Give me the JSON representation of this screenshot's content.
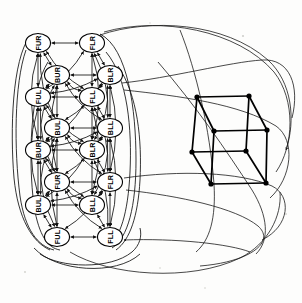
{
  "figure": {
    "background_color": "#fdfdfc",
    "ink_color": "#000000",
    "node_shape": "ellipse",
    "node_fill": "#ffffff",
    "edge_style": "directed-arrow"
  },
  "graph": {
    "name": "octant-transition-graph",
    "node_count": 16,
    "label_vocabulary": [
      "FUR",
      "FLR",
      "BUR",
      "BLR",
      "FUL",
      "FLL",
      "BUL",
      "BLL"
    ],
    "nodes": [
      {
        "id": "n0",
        "label": "FUR",
        "cx": 38,
        "cy": 43,
        "rx": 12.5,
        "ry": 9.5
      },
      {
        "id": "n1",
        "label": "FLR",
        "cx": 92,
        "cy": 43,
        "rx": 12.5,
        "ry": 9.5
      },
      {
        "id": "n2",
        "label": "BUR",
        "cx": 57,
        "cy": 75,
        "rx": 12.5,
        "ry": 9.5
      },
      {
        "id": "n3",
        "label": "BLR",
        "cx": 110,
        "cy": 75,
        "rx": 12.5,
        "ry": 9.5
      },
      {
        "id": "n4",
        "label": "FUL",
        "cx": 38,
        "cy": 97,
        "rx": 12.5,
        "ry": 9.5
      },
      {
        "id": "n5",
        "label": "FLL",
        "cx": 92,
        "cy": 97,
        "rx": 12.5,
        "ry": 9.5
      },
      {
        "id": "n6",
        "label": "BUL",
        "cx": 57,
        "cy": 128,
        "rx": 12.5,
        "ry": 9.5
      },
      {
        "id": "n7",
        "label": "BLL",
        "cx": 110,
        "cy": 128,
        "rx": 12.5,
        "ry": 9.5
      },
      {
        "id": "n8",
        "label": "BUR",
        "cx": 38,
        "cy": 150,
        "rx": 12.5,
        "ry": 9.5
      },
      {
        "id": "n9",
        "label": "BLR",
        "cx": 92,
        "cy": 150,
        "rx": 12.5,
        "ry": 9.5
      },
      {
        "id": "n10",
        "label": "FUR",
        "cx": 57,
        "cy": 182,
        "rx": 12.5,
        "ry": 9.5
      },
      {
        "id": "n11",
        "label": "FLR",
        "cx": 110,
        "cy": 182,
        "rx": 12.5,
        "ry": 9.5
      },
      {
        "id": "n12",
        "label": "BUL",
        "cx": 38,
        "cy": 205,
        "rx": 12.5,
        "ry": 9.5
      },
      {
        "id": "n13",
        "label": "BLL",
        "cx": 92,
        "cy": 205,
        "rx": 12.5,
        "ry": 9.5
      },
      {
        "id": "n14",
        "label": "FUL",
        "cx": 57,
        "cy": 237,
        "rx": 12.5,
        "ry": 9.5
      },
      {
        "id": "n15",
        "label": "FLL",
        "cx": 110,
        "cy": 237,
        "rx": 12.5,
        "ry": 9.5
      }
    ],
    "horizontal_pairs": [
      [
        "n0",
        "n1"
      ],
      [
        "n2",
        "n3"
      ],
      [
        "n4",
        "n5"
      ],
      [
        "n6",
        "n7"
      ],
      [
        "n8",
        "n9"
      ],
      [
        "n10",
        "n11"
      ],
      [
        "n12",
        "n13"
      ],
      [
        "n14",
        "n15"
      ]
    ],
    "vertical_pairs": [
      [
        "n0",
        "n4"
      ],
      [
        "n4",
        "n8"
      ],
      [
        "n8",
        "n12"
      ],
      [
        "n2",
        "n6"
      ],
      [
        "n6",
        "n10"
      ],
      [
        "n10",
        "n14"
      ],
      [
        "n1",
        "n5"
      ],
      [
        "n5",
        "n9"
      ],
      [
        "n9",
        "n13"
      ],
      [
        "n3",
        "n7"
      ],
      [
        "n7",
        "n11"
      ],
      [
        "n11",
        "n15"
      ]
    ],
    "diagonal_pairs": [
      [
        "n0",
        "n2"
      ],
      [
        "n2",
        "n4"
      ],
      [
        "n4",
        "n6"
      ],
      [
        "n6",
        "n8"
      ],
      [
        "n8",
        "n10"
      ],
      [
        "n10",
        "n12"
      ],
      [
        "n12",
        "n14"
      ],
      [
        "n1",
        "n3"
      ],
      [
        "n3",
        "n5"
      ],
      [
        "n5",
        "n7"
      ],
      [
        "n7",
        "n9"
      ],
      [
        "n9",
        "n11"
      ],
      [
        "n11",
        "n13"
      ],
      [
        "n13",
        "n15"
      ]
    ]
  },
  "cube": {
    "name": "reference-cube",
    "projection": "parallel-oblique",
    "vertex_count": 8,
    "edge_count": 12,
    "vertices": [
      {
        "id": "v0",
        "x": 197,
        "y": 97
      },
      {
        "id": "v1",
        "x": 249,
        "y": 96
      },
      {
        "id": "v2",
        "x": 214,
        "y": 131
      },
      {
        "id": "v3",
        "x": 267,
        "y": 130
      },
      {
        "id": "v4",
        "x": 192,
        "y": 152
      },
      {
        "id": "v5",
        "x": 246,
        "y": 151
      },
      {
        "id": "v6",
        "x": 211,
        "y": 184
      },
      {
        "id": "v7",
        "x": 266,
        "y": 183
      }
    ],
    "edges": [
      [
        "v0",
        "v1"
      ],
      [
        "v0",
        "v2"
      ],
      [
        "v1",
        "v3"
      ],
      [
        "v2",
        "v3"
      ],
      [
        "v0",
        "v4"
      ],
      [
        "v1",
        "v5"
      ],
      [
        "v2",
        "v6"
      ],
      [
        "v3",
        "v7"
      ],
      [
        "v4",
        "v5"
      ],
      [
        "v4",
        "v6"
      ],
      [
        "v5",
        "v7"
      ],
      [
        "v6",
        "v7"
      ]
    ]
  }
}
